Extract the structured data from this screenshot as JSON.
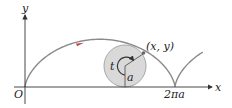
{
  "figure": {
    "type": "cycloid",
    "labels": {
      "y_axis": "y",
      "x_axis": "x",
      "origin": "O",
      "point": "(x, y)",
      "angle": "t",
      "radius": "a",
      "period_tick": "2πa"
    },
    "colors": {
      "curve": "#8a8a8a",
      "circle_fill": "#d9d9d9",
      "circle_stroke": "#a8a8a8",
      "axes": "#333333",
      "arrow_red": "#c0504d",
      "text": "#222222"
    }
  }
}
